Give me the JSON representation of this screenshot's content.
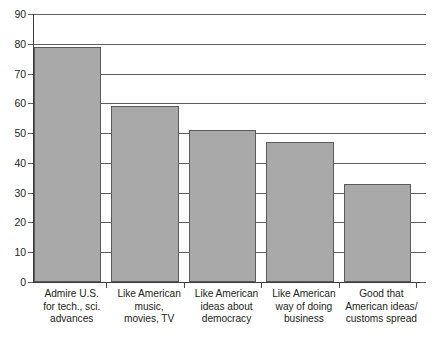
{
  "chart_data": {
    "type": "bar",
    "title": "",
    "subtitle": "",
    "xlabel": "",
    "ylabel": "",
    "ylim": [
      0,
      90
    ],
    "ytick_step": 10,
    "yticks": [
      "90",
      "80",
      "70",
      "60",
      "50",
      "40",
      "30",
      "20",
      "10",
      "0"
    ],
    "grid": true,
    "legend": false,
    "categories": [
      "Admire U.S.\nfor tech., sci.\nadvances",
      "Like American\nmusic,\nmovies, TV",
      "Like American\nideas about\ndemocracy",
      "Like American\nway of doing\nbusiness",
      "Good that\nAmerican ideas/\ncustoms spread"
    ],
    "values": [
      79,
      59,
      51,
      47,
      33
    ],
    "bar_color": "#a9a9a9",
    "bar_edge_color": "#5a5a5a",
    "axis_color": "#3b3b3b"
  },
  "axis": {
    "y_ticks": [
      {
        "label": "90",
        "value": 90
      },
      {
        "label": "80",
        "value": 80
      },
      {
        "label": "70",
        "value": 70
      },
      {
        "label": "60",
        "value": 60
      },
      {
        "label": "50",
        "value": 50
      },
      {
        "label": "40",
        "value": 40
      },
      {
        "label": "30",
        "value": 30
      },
      {
        "label": "20",
        "value": 20
      },
      {
        "label": "10",
        "value": 10
      },
      {
        "label": "0",
        "value": 0
      }
    ]
  },
  "bars": [
    {
      "value": 79,
      "label_line1": "Admire U.S.",
      "label_line2": "for tech., sci.",
      "label_line3": "advances"
    },
    {
      "value": 59,
      "label_line1": "Like American",
      "label_line2": "music,",
      "label_line3": "movies, TV"
    },
    {
      "value": 51,
      "label_line1": "Like American",
      "label_line2": "ideas about",
      "label_line3": "democracy"
    },
    {
      "value": 47,
      "label_line1": "Like American",
      "label_line2": "way of doing",
      "label_line3": "business"
    },
    {
      "value": 33,
      "label_line1": "Good that",
      "label_line2": "American ideas/",
      "label_line3": "customs spread"
    }
  ]
}
